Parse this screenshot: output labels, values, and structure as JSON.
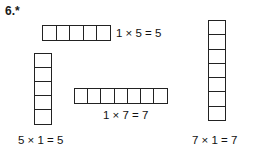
{
  "exercise": {
    "number_label": "6.*"
  },
  "arrays": {
    "top": {
      "name": "one-by-five-row",
      "orientation": "horizontal",
      "rows": 1,
      "columns": 5,
      "cell_count": 5,
      "equation": "1 × 5 = 5"
    },
    "left": {
      "name": "five-by-one-column",
      "orientation": "vertical",
      "rows": 5,
      "columns": 1,
      "cell_count": 5,
      "equation": "5 × 1 = 5"
    },
    "middle": {
      "name": "one-by-seven-row",
      "orientation": "horizontal",
      "rows": 1,
      "columns": 7,
      "cell_count": 7,
      "equation": "1 × 7 = 7"
    },
    "right": {
      "name": "seven-by-one-column",
      "orientation": "vertical",
      "rows": 7,
      "columns": 1,
      "cell_count": 7,
      "equation": "7 × 1 = 7"
    }
  },
  "colors": {
    "background": "#ffffff",
    "ink": "#1a1a1a",
    "cell_border": "#222222"
  }
}
